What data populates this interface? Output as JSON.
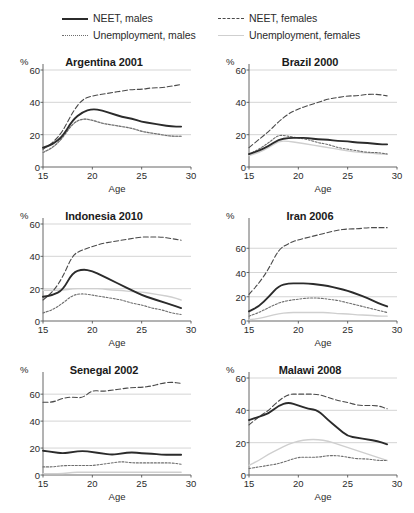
{
  "legend": {
    "items": [
      {
        "label": "NEET, males",
        "style": "solid-dark",
        "name": "legend-neet-males"
      },
      {
        "label": "Unemployment, males",
        "style": "dotted-dark",
        "name": "legend-unemployment-males"
      },
      {
        "label": "NEET, females",
        "style": "dashed-dark",
        "name": "legend-neet-females"
      },
      {
        "label": "Unemployment, females",
        "style": "solid-light",
        "name": "legend-unemployment-females"
      }
    ]
  },
  "axis": {
    "ylabel": "%",
    "xlabel": "Age",
    "xticks": [
      15,
      20,
      25,
      30
    ],
    "xlim": [
      15,
      30
    ]
  },
  "colors": {
    "neet_males": "#2b2b2b",
    "neet_females": "#4a4a4a",
    "unemployment_males": "#6e6e6e",
    "unemployment_females": "#cfcfcf",
    "gridline": "#b8b8b8",
    "axis": "#555555",
    "text": "#1a1a1a"
  },
  "chart_data": [
    {
      "type": "line",
      "title": "Argentina 2001",
      "xlabel": "Age",
      "ylabel": "%",
      "xlim": [
        15,
        30
      ],
      "ylim": [
        0,
        60
      ],
      "yticks": [
        0,
        20,
        40,
        60
      ],
      "xticks": [
        15,
        20,
        25,
        30
      ],
      "grid": true,
      "x": [
        15,
        16,
        17,
        18,
        19,
        20,
        21,
        22,
        23,
        24,
        25,
        26,
        27,
        28,
        29
      ],
      "series": [
        {
          "name": "NEET, males",
          "values": [
            12,
            14,
            19,
            29,
            34,
            36,
            35,
            33,
            31,
            30,
            28,
            27,
            26,
            25,
            25
          ]
        },
        {
          "name": "NEET, females",
          "values": [
            11,
            15,
            22,
            34,
            42,
            44,
            45,
            46,
            47,
            48,
            48,
            49,
            49,
            50,
            51
          ]
        },
        {
          "name": "Unemployment, males",
          "values": [
            9,
            12,
            18,
            27,
            30,
            29,
            27,
            26,
            25,
            24,
            22,
            21,
            20,
            19,
            19
          ]
        },
        {
          "name": "Unemployment, females",
          "values": [
            9,
            12,
            18,
            27,
            30,
            29,
            27,
            26,
            25,
            24,
            22,
            21,
            20,
            19,
            19
          ]
        }
      ]
    },
    {
      "type": "line",
      "title": "Brazil 2000",
      "xlabel": "Age",
      "ylabel": "%",
      "xlim": [
        15,
        30
      ],
      "ylim": [
        0,
        60
      ],
      "yticks": [
        0,
        20,
        40,
        60
      ],
      "xticks": [
        15,
        20,
        25,
        30
      ],
      "grid": true,
      "x": [
        15,
        16,
        17,
        18,
        19,
        20,
        21,
        22,
        23,
        24,
        25,
        26,
        27,
        28,
        29
      ],
      "series": [
        {
          "name": "NEET, males",
          "values": [
            8,
            10,
            13,
            17,
            18,
            18,
            18,
            17,
            17,
            16,
            16,
            15,
            15,
            14,
            14
          ]
        },
        {
          "name": "NEET, females",
          "values": [
            12,
            17,
            22,
            28,
            33,
            36,
            38,
            40,
            42,
            43,
            44,
            44,
            45,
            45,
            44
          ]
        },
        {
          "name": "Unemployment, males",
          "values": [
            8,
            11,
            15,
            20,
            19,
            18,
            17,
            15,
            14,
            12,
            11,
            10,
            9,
            9,
            8
          ]
        },
        {
          "name": "Unemployment, females",
          "values": [
            7,
            9,
            12,
            16,
            16,
            15,
            14,
            13,
            12,
            11,
            10,
            9,
            9,
            8,
            8
          ]
        }
      ]
    },
    {
      "type": "line",
      "title": "Indonesia 2010",
      "xlabel": "Age",
      "ylabel": "%",
      "xlim": [
        15,
        30
      ],
      "ylim": [
        0,
        60
      ],
      "yticks": [
        0,
        20,
        40,
        60
      ],
      "xticks": [
        15,
        20,
        25,
        30
      ],
      "grid": true,
      "x": [
        15,
        16,
        17,
        18,
        19,
        20,
        21,
        22,
        23,
        24,
        25,
        26,
        27,
        28,
        29
      ],
      "series": [
        {
          "name": "NEET, males",
          "values": [
            15,
            16,
            19,
            30,
            32,
            31,
            28,
            25,
            22,
            19,
            16,
            14,
            12,
            10,
            8
          ]
        },
        {
          "name": "NEET, females",
          "values": [
            13,
            18,
            27,
            41,
            44,
            46,
            48,
            49,
            50,
            51,
            52,
            52,
            52,
            51,
            50
          ]
        },
        {
          "name": "Unemployment, males",
          "values": [
            5,
            7,
            11,
            16,
            17,
            16,
            15,
            14,
            13,
            11,
            10,
            8,
            7,
            5,
            4
          ]
        },
        {
          "name": "Unemployment, females",
          "values": [
            19,
            19,
            19,
            20,
            20,
            20,
            20,
            19,
            19,
            18,
            18,
            17,
            16,
            15,
            13
          ]
        }
      ]
    },
    {
      "type": "line",
      "title": "Iran 2006",
      "xlabel": "Age",
      "ylabel": "%",
      "xlim": [
        15,
        80
      ],
      "ylim": [
        0,
        80
      ],
      "yticks": [
        0,
        20,
        40,
        60
      ],
      "xticks": [
        15,
        20,
        25,
        30
      ],
      "grid": true,
      "x": [
        15,
        16,
        17,
        18,
        19,
        20,
        21,
        22,
        23,
        24,
        25,
        26,
        27,
        28,
        29
      ],
      "series": [
        {
          "name": "NEET, males",
          "values": [
            8,
            12,
            20,
            29,
            31,
            31,
            31,
            30,
            29,
            27,
            25,
            22,
            19,
            15,
            12
          ]
        },
        {
          "name": "NEET, females",
          "values": [
            22,
            31,
            43,
            59,
            64,
            67,
            69,
            71,
            73,
            75,
            76,
            76,
            77,
            77,
            77
          ]
        },
        {
          "name": "Unemployment, males",
          "values": [
            4,
            7,
            11,
            15,
            17,
            18,
            19,
            19,
            18,
            17,
            15,
            13,
            11,
            9,
            7
          ]
        },
        {
          "name": "Unemployment, females",
          "values": [
            1,
            2,
            4,
            6,
            7,
            7,
            7,
            7,
            7,
            6,
            6,
            5,
            5,
            4,
            4
          ]
        }
      ]
    },
    {
      "type": "line",
      "title": "Senegal 2002",
      "xlabel": "Age",
      "ylabel": "%",
      "xlim": [
        15,
        30
      ],
      "ylim": [
        0,
        72
      ],
      "yticks": [
        0,
        20,
        40,
        60
      ],
      "xticks": [
        15,
        20,
        25,
        30
      ],
      "grid": true,
      "x": [
        15,
        16,
        17,
        18,
        19,
        20,
        21,
        22,
        23,
        24,
        25,
        26,
        27,
        28,
        29
      ],
      "series": [
        {
          "name": "NEET, males",
          "values": [
            18,
            17,
            16,
            17,
            18,
            17,
            16,
            15,
            16,
            17,
            16,
            16,
            15,
            15,
            15
          ]
        },
        {
          "name": "NEET, females",
          "values": [
            54,
            54,
            57,
            58,
            57,
            63,
            62,
            63,
            64,
            65,
            65,
            66,
            68,
            69,
            68
          ]
        },
        {
          "name": "Unemployment, males",
          "values": [
            6,
            6,
            7,
            7,
            7,
            7,
            8,
            9,
            10,
            9,
            9,
            9,
            9,
            9,
            8
          ]
        },
        {
          "name": "Unemployment, females",
          "values": [
            1,
            1,
            1,
            2,
            2,
            2,
            2,
            2,
            2,
            2,
            2,
            2,
            2,
            2,
            2
          ]
        }
      ]
    },
    {
      "type": "line",
      "title": "Malawi 2008",
      "xlabel": "Age",
      "ylabel": "%",
      "xlim": [
        15,
        30
      ],
      "ylim": [
        0,
        60
      ],
      "yticks": [
        0,
        20,
        40,
        60
      ],
      "xticks": [
        15,
        20,
        25,
        30
      ],
      "grid": true,
      "x": [
        15,
        16,
        17,
        18,
        19,
        20,
        21,
        22,
        23,
        24,
        25,
        26,
        27,
        28,
        29
      ],
      "series": [
        {
          "name": "NEET, males",
          "values": [
            34,
            36,
            38,
            43,
            45,
            43,
            41,
            40,
            34,
            29,
            24,
            23,
            22,
            21,
            19
          ]
        },
        {
          "name": "NEET, females",
          "values": [
            31,
            36,
            40,
            46,
            50,
            50,
            50,
            50,
            48,
            46,
            45,
            43,
            43,
            43,
            41
          ]
        },
        {
          "name": "Unemployment, males",
          "values": [
            4,
            5,
            6,
            7,
            9,
            11,
            11,
            11,
            12,
            12,
            11,
            10,
            10,
            9,
            9
          ]
        },
        {
          "name": "Unemployment, females",
          "values": [
            6,
            9,
            13,
            16,
            19,
            21,
            22,
            22,
            21,
            19,
            17,
            15,
            13,
            11,
            9
          ]
        }
      ]
    }
  ]
}
